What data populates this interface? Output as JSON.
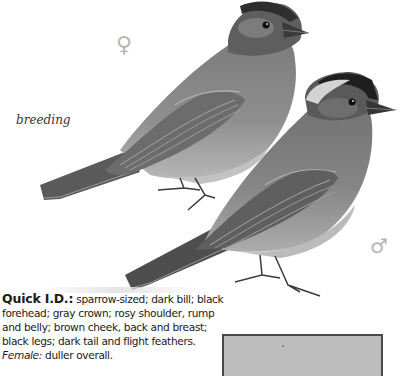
{
  "page": {
    "label": "breeding",
    "symbols": {
      "female": "♀",
      "male": "♂"
    },
    "quick_id": {
      "heading": "Quick I.D.:",
      "lines": [
        "sparrow-sized; dark bill; black",
        "forehead; gray crown; rosy shoulder, rump",
        "and belly; brown cheek, back and breast;",
        "black legs; dark tail and flight feathers."
      ],
      "female_label": "Female:",
      "female_text": "duller overall."
    },
    "illustrations": [
      {
        "name": "female-bird",
        "sex": "female",
        "colors": {
          "body": "#8a8a8a",
          "wing": "#6e6e6e",
          "head": "#555555",
          "belly": "#b0b0b0"
        }
      },
      {
        "name": "male-bird",
        "sex": "male",
        "colors": {
          "body": "#7f7f7f",
          "wing": "#5f5f5f",
          "head": "#2a2a2a",
          "crown": "#d8d8d8",
          "belly": "#a8a8a8"
        }
      }
    ],
    "map": {
      "fill": "#bdbdbd",
      "border": "#4a4a4a"
    }
  }
}
